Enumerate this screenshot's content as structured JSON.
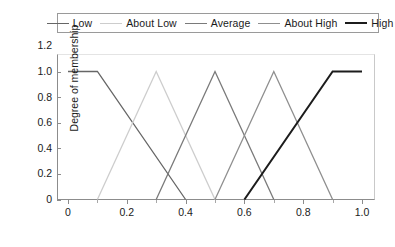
{
  "chart_data": {
    "type": "line",
    "title": "",
    "subtitle": "",
    "xlabel": "",
    "ylabel": "Degree of membership",
    "xlim": [
      0,
      1.0
    ],
    "ylim": [
      0,
      1.2
    ],
    "grid": false,
    "legend_position": "top",
    "x_ticks": [
      {
        "value": 0,
        "label": "0"
      },
      {
        "value": 0.2,
        "label": "0.2"
      },
      {
        "value": 0.4,
        "label": "0.4"
      },
      {
        "value": 0.6,
        "label": "0.6"
      },
      {
        "value": 0.8,
        "label": "0.8"
      },
      {
        "value": 1.0,
        "label": "1.0"
      }
    ],
    "x_minor_ticks": [
      0.1,
      0.3,
      0.5,
      0.7,
      0.9
    ],
    "y_ticks": [
      {
        "value": 0,
        "label": "0"
      },
      {
        "value": 0.2,
        "label": "0.2"
      },
      {
        "value": 0.4,
        "label": "0.4"
      },
      {
        "value": 0.6,
        "label": "0.6"
      },
      {
        "value": 0.8,
        "label": "0.8"
      },
      {
        "value": 1.0,
        "label": "1.0"
      },
      {
        "value": 1.2,
        "label": "1.2"
      }
    ],
    "series": [
      {
        "name": "Low",
        "color": "#666666",
        "width": 1.3,
        "points": [
          [
            0.0,
            1.0
          ],
          [
            0.1,
            1.0
          ],
          [
            0.4,
            0.0
          ]
        ]
      },
      {
        "name": "About Low",
        "color": "#cdcdcd",
        "width": 1.3,
        "points": [
          [
            0.1,
            0.0
          ],
          [
            0.3,
            1.0
          ],
          [
            0.5,
            0.0
          ]
        ]
      },
      {
        "name": "Average",
        "color": "#7a7a7a",
        "width": 1.3,
        "points": [
          [
            0.3,
            0.0
          ],
          [
            0.5,
            1.0
          ],
          [
            0.7,
            0.0
          ]
        ]
      },
      {
        "name": "About High",
        "color": "#8f8f8f",
        "width": 1.3,
        "points": [
          [
            0.5,
            0.0
          ],
          [
            0.7,
            1.0
          ],
          [
            0.9,
            0.0
          ]
        ]
      },
      {
        "name": "High",
        "color": "#1c1c1c",
        "width": 2.0,
        "points": [
          [
            0.6,
            0.0
          ],
          [
            0.9,
            1.0
          ],
          [
            1.0,
            1.0
          ]
        ]
      }
    ]
  },
  "legend": {
    "entries": [
      {
        "label": "Low",
        "color": "#666666",
        "width": 1.3
      },
      {
        "label": "About Low",
        "color": "#cdcdcd",
        "width": 1.3
      },
      {
        "label": "Average",
        "color": "#7a7a7a",
        "width": 1.3
      },
      {
        "label": "About High",
        "color": "#8f8f8f",
        "width": 1.3
      },
      {
        "label": "High",
        "color": "#1c1c1c",
        "width": 2.2
      }
    ]
  }
}
